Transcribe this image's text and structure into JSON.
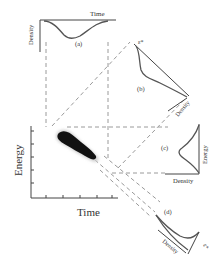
{
  "figure": {
    "main_plot": {
      "xlabel": "Time",
      "ylabel": "Energy"
    },
    "panels": [
      {
        "id": "a",
        "label": "(a)",
        "xlabel": "Time",
        "ylabel": "Density"
      },
      {
        "id": "b",
        "label": "(b)",
        "axis_label": "Density",
        "axis_symbol": "ε*"
      },
      {
        "id": "c",
        "label": "(c)",
        "xlabel": "Density",
        "ylabel": "Energy"
      },
      {
        "id": "d",
        "label": "(d)",
        "axis_label": "Density",
        "axis_symbol": "ε*"
      }
    ],
    "colors": {
      "axes": "#444444",
      "curves": "#555555",
      "projection_lines": "#9a9a9a",
      "scatter": "#111111"
    }
  }
}
